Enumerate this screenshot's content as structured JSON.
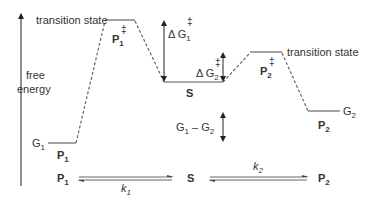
{
  "diagram": {
    "axis": {
      "label_line1": "free",
      "label_line2": "energy"
    },
    "ts1": {
      "label": "transition state",
      "name": "P",
      "sub": "1",
      "dagger": "‡"
    },
    "ts2": {
      "label": "transition state",
      "name": "P",
      "sub": "2",
      "dagger": "‡"
    },
    "p1": {
      "energy_label": "G",
      "energy_sub": "1",
      "name": "P",
      "sub": "1"
    },
    "s": {
      "name": "S"
    },
    "p2": {
      "energy_label": "G",
      "energy_sub": "2",
      "name": "P",
      "sub": "2"
    },
    "dG1": {
      "prefix": "Δ G",
      "sub": "1",
      "dagger": "‡"
    },
    "dG2": {
      "prefix": "Δ G",
      "sub": "2",
      "dagger": "‡"
    },
    "diff": {
      "g1": "G",
      "g1_sub": "1",
      "minus": " – ",
      "g2": "G",
      "g2_sub": "2"
    },
    "equilibrium": {
      "left": "P",
      "left_sub": "1",
      "middle": "S",
      "right": "P",
      "right_sub": "2",
      "k1": "k",
      "k1_sub": "1",
      "k2": "k",
      "k2_sub": "2"
    },
    "colors": {
      "line": "#555555",
      "text": "#333333",
      "arrow": "#222222"
    }
  }
}
